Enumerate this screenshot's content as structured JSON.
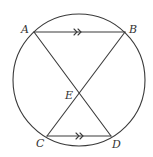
{
  "diagram": {
    "type": "circle-geometry",
    "stroke_color": "#3a3a3a",
    "circle": {
      "cx": 79,
      "cy": 80,
      "r": 66
    },
    "points": {
      "A": {
        "label": "A",
        "x": 34,
        "y": 32
      },
      "B": {
        "label": "B",
        "x": 125,
        "y": 32
      },
      "C": {
        "label": "C",
        "x": 47,
        "y": 136
      },
      "D": {
        "label": "D",
        "x": 111,
        "y": 136
      },
      "E": {
        "label": "E",
        "x": 79,
        "y": 93
      }
    },
    "segments": [
      "AB",
      "CD",
      "AD",
      "BC"
    ],
    "parallel_marks": {
      "AB": ">>",
      "CD": ">>"
    },
    "labels": {
      "A": "A",
      "B": "B",
      "C": "C",
      "D": "D",
      "E": "E"
    }
  }
}
